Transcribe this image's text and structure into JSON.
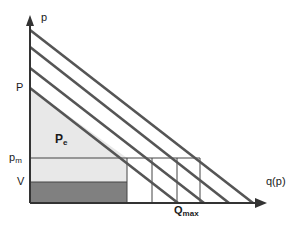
{
  "figure": {
    "axes": {
      "y_label": "p",
      "x_label": "q(p)",
      "axis_color": "#333333",
      "origin": {
        "x": 30,
        "y": 203
      },
      "y_top": 17,
      "x_right": 267
    },
    "labels": {
      "price_P": "P",
      "price_pm_base": "p",
      "price_pm_sub": "m",
      "value_V": "V",
      "producer_surplus_base": "P",
      "producer_surplus_sub": "e",
      "qmax_base": "Q",
      "qmax_sub": "max",
      "y_axis": "p",
      "x_axis": "q(p)"
    },
    "colors": {
      "light_gray_fill": "#e8e8e8",
      "dark_gray_fill": "#808080",
      "demand_line": "#555555",
      "thin_line": "#444444",
      "axis": "#333333",
      "background": "#ffffff",
      "text": "#1a1a1a"
    },
    "demand_curves": [
      {
        "name": "demand-curve-1",
        "x1": 30,
        "y1": 30,
        "x2": 253,
        "y2": 203
      },
      {
        "name": "demand-curve-2",
        "x1": 30,
        "y1": 47,
        "x2": 229,
        "y2": 203
      },
      {
        "name": "demand-curve-3",
        "x1": 30,
        "y1": 68,
        "x2": 204,
        "y2": 203
      },
      {
        "name": "demand-curve-4",
        "x1": 30,
        "y1": 88,
        "x2": 178,
        "y2": 203
      }
    ],
    "price_levels": {
      "P": 88,
      "p_m": 158,
      "V": 182
    },
    "vertical_grid_lines": [
      127,
      152,
      177,
      200
    ],
    "shaded_regions": {
      "producer_surplus_triangle": {
        "x_left": 30,
        "y_top": 88,
        "y_bottom": 158,
        "x_right": 127
      },
      "producer_surplus_rect": {
        "x_left": 30,
        "x_right": 127,
        "y_top": 158,
        "y_bottom": 182
      },
      "variable_cost_rect": {
        "x_left": 30,
        "x_right": 127,
        "y_top": 182,
        "y_bottom": 203
      }
    },
    "qmax_marker_x": 192
  }
}
